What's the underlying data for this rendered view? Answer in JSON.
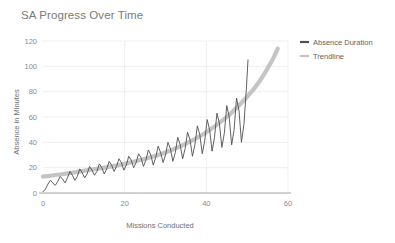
{
  "chart_data": {
    "type": "line",
    "title": "SA Progress Over Time",
    "xlabel": "Missions Conducted",
    "ylabel": "Absence in Minutes",
    "xlim": [
      0,
      60
    ],
    "ylim": [
      0,
      120
    ],
    "xticks": [
      "0",
      "20",
      "40",
      "60"
    ],
    "xtick_values": [
      0,
      20,
      40,
      60
    ],
    "yticks": [
      "0",
      "20",
      "40",
      "60",
      "80",
      "100",
      "120"
    ],
    "ytick_values": [
      0,
      20,
      40,
      60,
      80,
      100,
      120
    ],
    "grid": true,
    "legend_position": "right",
    "colors": {
      "absence_duration": "#4f4f4f",
      "trendline": "#c4c4c4",
      "grid": "#e8e8e8",
      "axis": "#9a9a9a",
      "title_text": "#7a7a7a",
      "tick_text": "#8a8a8a",
      "background": "#ffffff"
    },
    "series": [
      {
        "name": "Absence Duration",
        "x": [
          0,
          0.6,
          1.2,
          1.8,
          2.4,
          3,
          3.6,
          4.2,
          4.8,
          5.4,
          6,
          6.6,
          7.2,
          7.8,
          8.4,
          9,
          9.6,
          10.2,
          10.8,
          11.4,
          12,
          12.6,
          13.2,
          13.8,
          14.4,
          15,
          15.6,
          16.2,
          16.8,
          17.4,
          18,
          18.6,
          19.2,
          19.8,
          20.4,
          21,
          21.6,
          22.2,
          22.8,
          23.4,
          24,
          24.6,
          25.2,
          25.8,
          26.4,
          27,
          27.6,
          28.2,
          28.8,
          29.4,
          30,
          30.6,
          31.2,
          31.8,
          32.4,
          33,
          33.6,
          34.2,
          34.8,
          35.4,
          36,
          36.6,
          37.2,
          37.8,
          38.4,
          39,
          39.6,
          40.2,
          40.8,
          41.4,
          42,
          42.6,
          43.2,
          43.8,
          44.4,
          45,
          45.6,
          46.2,
          46.8,
          47.4,
          48,
          48.6,
          49.2,
          49.8,
          50.2
        ],
        "values": [
          1,
          3,
          7,
          10,
          8,
          6,
          9,
          13,
          11,
          8,
          12,
          17,
          14,
          10,
          13,
          19,
          16,
          12,
          15,
          21,
          18,
          14,
          17,
          23,
          20,
          15,
          19,
          25,
          22,
          17,
          21,
          27,
          24,
          18,
          22,
          29,
          26,
          20,
          24,
          31,
          28,
          21,
          26,
          34,
          30,
          22,
          28,
          37,
          32,
          24,
          30,
          40,
          35,
          25,
          32,
          44,
          38,
          27,
          35,
          48,
          42,
          29,
          38,
          53,
          46,
          31,
          41,
          58,
          50,
          33,
          44,
          63,
          55,
          36,
          47,
          69,
          60,
          38,
          50,
          75,
          65,
          40,
          54,
          82,
          105
        ]
      },
      {
        "name": "Trendline",
        "x": [
          0,
          5,
          10,
          15,
          20,
          25,
          30,
          35,
          40,
          45,
          50,
          53,
          56,
          57.5
        ],
        "values": [
          13,
          15,
          17.5,
          20,
          23,
          27,
          32,
          39,
          48,
          60,
          76,
          88,
          104,
          114
        ]
      }
    ],
    "legend": [
      {
        "label": "Absence Duration",
        "color": "#4f4f4f"
      },
      {
        "label": "Trendline",
        "color": "#c4c4c4"
      }
    ]
  }
}
